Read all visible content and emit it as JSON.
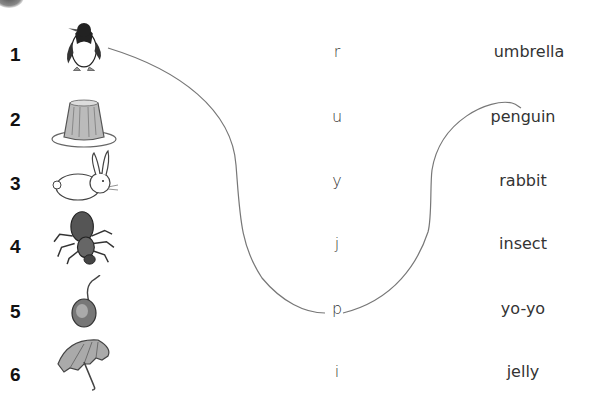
{
  "worksheet": {
    "type": "picture-letter-word matching exercise",
    "items": [
      {
        "number": "1",
        "picture": "penguin-icon",
        "letter": "r",
        "word": "umbrella"
      },
      {
        "number": "2",
        "picture": "jelly-icon",
        "letter": "u",
        "word": "penguin"
      },
      {
        "number": "3",
        "picture": "rabbit-icon",
        "letter": "y",
        "word": "rabbit"
      },
      {
        "number": "4",
        "picture": "insect-icon",
        "letter": "j",
        "word": "insect"
      },
      {
        "number": "5",
        "picture": "yo-yo-icon",
        "letter": "p",
        "word": "yo-yo"
      },
      {
        "number": "6",
        "picture": "umbrella-icon",
        "letter": "i",
        "word": "jelly"
      }
    ],
    "drawn_connections": [
      {
        "from": "picture 1 (penguin)",
        "to": "letter p"
      },
      {
        "from": "letter p",
        "to": "word penguin"
      }
    ]
  }
}
